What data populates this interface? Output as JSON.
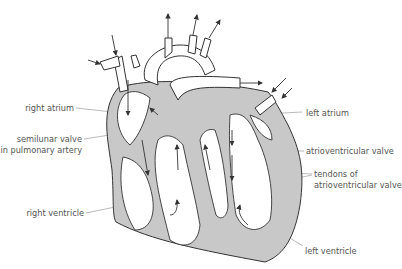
{
  "diagram": {
    "colors": {
      "wall": "#c8c8c8",
      "outline": "#333333",
      "label": "#555555",
      "leader": "#aaaaaa"
    },
    "labels": {
      "right_atrium": "right atrium",
      "semilunar_valve_1": "semilunar valve",
      "semilunar_valve_2": "in pulmonary artery",
      "right_ventricle": "right ventricle",
      "left_atrium": "left atrium",
      "atrioventricular_valve": "atrioventricular valve",
      "tendons_1": "tendons of",
      "tendons_2": "atrioventricular valve",
      "left_ventricle": "left ventricle"
    }
  }
}
